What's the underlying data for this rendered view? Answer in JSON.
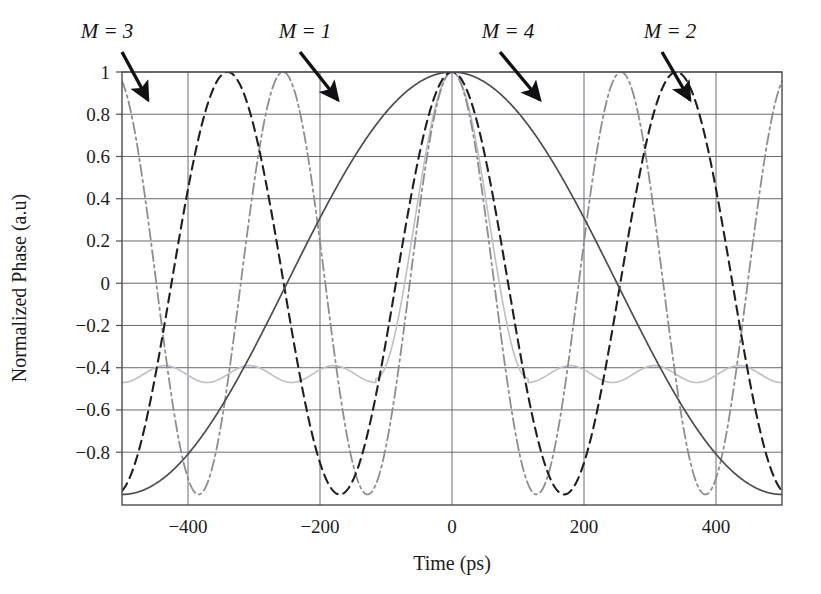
{
  "chart_data": {
    "type": "line",
    "title": "",
    "subtitle": "",
    "xlabel": "Time (ps)",
    "ylabel": "Normalized Phase (a.u)",
    "xlim": [
      -500,
      500
    ],
    "ylim": [
      -1.05,
      1.0
    ],
    "grid": true,
    "legend_position": "inline-annotations",
    "x_ticks": [
      -400,
      -200,
      0,
      200,
      400
    ],
    "x_tick_labels": [
      "−400",
      "−200",
      "0",
      "200",
      "400"
    ],
    "y_ticks": [
      1,
      0.8,
      0.6,
      0.4,
      0.2,
      0,
      -0.2,
      -0.4,
      -0.6,
      -0.8
    ],
    "y_tick_labels": [
      "1",
      "0.8",
      "0.6",
      "0.4",
      "0.2",
      "0",
      "−0.2",
      "−0.4",
      "−0.6",
      "−0.8"
    ],
    "x_gridlines": [
      -400,
      -200,
      0,
      200,
      400
    ],
    "y_gridlines": [
      1,
      0.8,
      0.6,
      0.4,
      0.2,
      0,
      -0.2,
      -0.4,
      -0.6,
      -0.8
    ],
    "annotations": [
      {
        "text": "M = 3",
        "label_x": 107,
        "label_y": 38,
        "arrow_from_x": 122,
        "arrow_from_y": 52,
        "arrow_to_x": 148,
        "arrow_to_y": 100
      },
      {
        "text": "M = 1",
        "label_x": 305,
        "label_y": 38,
        "arrow_from_x": 300,
        "arrow_from_y": 52,
        "arrow_to_x": 338,
        "arrow_to_y": 100
      },
      {
        "text": "M = 4",
        "label_x": 508,
        "label_y": 38,
        "arrow_from_x": 500,
        "arrow_from_y": 52,
        "arrow_to_x": 540,
        "arrow_to_y": 100
      },
      {
        "text": "M = 2",
        "label_x": 670,
        "label_y": 38,
        "arrow_from_x": 662,
        "arrow_from_y": 52,
        "arrow_to_x": 690,
        "arrow_to_y": 100
      }
    ],
    "series": [
      {
        "name": "M = 1",
        "label": "M = 1",
        "color": "#4d4d52",
        "dash": "solid",
        "width": 1.7,
        "formula": "cos(pi*t/500)",
        "period_ps": 1000,
        "peaks_t": [
          0
        ],
        "minima_t": [
          -500,
          500
        ],
        "min_value": -1.0,
        "max_value": 1.0
      },
      {
        "name": "M = 2",
        "label": "M = 2",
        "color": "#1f1f24",
        "dash": "dashed",
        "width": 2.1,
        "formula": "cos(pi*t/170)",
        "period_ps": 340,
        "peaks_t": [
          -500,
          -340,
          0,
          340,
          500
        ],
        "minima_t": [
          -170,
          170
        ],
        "min_value": -1.0,
        "max_value": 1.0
      },
      {
        "name": "M = 3",
        "label": "M = 3",
        "color": "#8d8d93",
        "dash": "dashdot",
        "width": 1.8,
        "formula": "cos(pi*t/128)",
        "period_ps": 256,
        "peaks_t": [
          -500,
          -384,
          -256,
          -128,
          0,
          128,
          256,
          384,
          500
        ],
        "minima_t": [
          -448,
          -320,
          -192,
          -64,
          64,
          192,
          320,
          448
        ],
        "min_value": -1.0,
        "max_value": 1.0
      },
      {
        "name": "M = 4",
        "label": "M = 4",
        "color": "#bfbfc4",
        "dash": "solid-light",
        "width": 1.6,
        "formula": "sidelobe-modulated main lobe, peak 1 at t=0, sidelobe floor ~ -0.45",
        "main_lobe_halfwidth_ps": 115,
        "sidelobe_min_value": -0.47,
        "sidelobe_local_max_value": -0.39,
        "min_value": -0.47,
        "max_value": 1.0
      }
    ],
    "sampled_points": {
      "t": [
        -500,
        -450,
        -400,
        -350,
        -300,
        -250,
        -200,
        -150,
        -100,
        -50,
        0,
        50,
        100,
        150,
        200,
        250,
        300,
        350,
        400,
        450,
        500
      ],
      "M1": [
        -1.0,
        -0.988,
        -0.951,
        -0.891,
        -0.809,
        -0.707,
        -0.588,
        -0.454,
        -0.309,
        -0.156,
        1.0,
        -0.156,
        -0.309,
        -0.454,
        -0.588,
        -0.707,
        -0.809,
        -0.891,
        -0.951,
        -0.988,
        -1.0
      ],
      "M2": [
        1.0,
        0.32,
        -0.69,
        -0.91,
        0.06,
        0.97,
        0.45,
        -0.6,
        -0.95,
        -0.06,
        1.0,
        -0.06,
        -0.95,
        -0.6,
        0.45,
        0.97,
        0.06,
        -0.91,
        -0.69,
        0.32,
        1.0
      ],
      "M3": [
        0.83,
        -0.19,
        -0.72,
        0.98,
        -0.37,
        -0.56,
        0.93,
        -0.54,
        -0.38,
        0.85,
        1.0,
        0.85,
        -0.38,
        -0.54,
        0.93,
        -0.56,
        -0.37,
        0.98,
        -0.72,
        -0.19,
        0.83
      ],
      "M4": [
        -0.45,
        -0.41,
        -0.46,
        -0.4,
        -0.46,
        -0.44,
        -0.42,
        -0.46,
        -0.3,
        0.58,
        1.0,
        0.58,
        -0.3,
        -0.46,
        -0.42,
        -0.44,
        -0.46,
        -0.4,
        -0.46,
        -0.41,
        -0.45
      ]
    }
  },
  "figure": {
    "plot_left_px": 122,
    "plot_right_px": 782,
    "plot_top_px": 72,
    "plot_bottom_px": 505,
    "axis_color": "#50505a",
    "grid_color": "#6a6a74",
    "background": "#ffffff"
  }
}
